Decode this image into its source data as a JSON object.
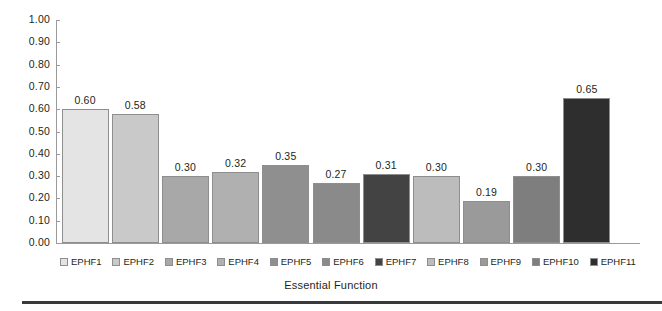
{
  "chart_data": {
    "type": "bar",
    "title": "",
    "subtitle": "",
    "xlabel": "Essential Function",
    "ylabel": "",
    "ylim": [
      0,
      1.0
    ],
    "ytick_step": 0.1,
    "grid": false,
    "legend_position": "bottom",
    "categories": [
      "EPHF1",
      "EPHF2",
      "EPHF3",
      "EPHF4",
      "EPHF5",
      "EPHF6",
      "EPHF7",
      "EPHF8",
      "EPHF9",
      "EPHF10",
      "EPHF11"
    ],
    "values": [
      0.6,
      0.58,
      0.3,
      0.32,
      0.35,
      0.27,
      0.31,
      0.3,
      0.19,
      0.3,
      0.65
    ],
    "value_labels": [
      "0.60",
      "0.58",
      "0.30",
      "0.32",
      "0.35",
      "0.27",
      "0.31",
      "0.30",
      "0.19",
      "0.30",
      "0.65"
    ],
    "bar_colors": [
      "#e4e4e4",
      "#c9c9c9",
      "#a8a8a8",
      "#b0b0b0",
      "#8f8f8f",
      "#8a8a8a",
      "#434343",
      "#bcbcbc",
      "#9a9a9a",
      "#7e7e7e",
      "#2e2e2e"
    ],
    "ytick_labels": [
      "1.00",
      "0.90",
      "0.80",
      "0.70",
      "0.60",
      "0.50",
      "0.40",
      "0.30",
      "0.20",
      "0.10",
      "0.00"
    ],
    "ytick_values": [
      1.0,
      0.9,
      0.8,
      0.7,
      0.6,
      0.5,
      0.4,
      0.3,
      0.2,
      0.1,
      0.0
    ],
    "axis_color": "#9a9a9a",
    "text_color": "#231f20"
  },
  "legend": {
    "items": [
      {
        "label": "EPHF1",
        "color": "#e4e4e4"
      },
      {
        "label": "EPHF2",
        "color": "#c9c9c9"
      },
      {
        "label": "EPHF3",
        "color": "#a8a8a8"
      },
      {
        "label": "EPHF4",
        "color": "#b0b0b0"
      },
      {
        "label": "EPHF5",
        "color": "#8f8f8f"
      },
      {
        "label": "EPHF6",
        "color": "#8a8a8a"
      },
      {
        "label": "EPHF7",
        "color": "#434343"
      },
      {
        "label": "EPHF8",
        "color": "#bcbcbc"
      },
      {
        "label": "EPHF9",
        "color": "#9a9a9a"
      },
      {
        "label": "EPHF10",
        "color": "#7e7e7e"
      },
      {
        "label": "EPHF11",
        "color": "#2e2e2e"
      }
    ]
  },
  "footer": {
    "rule_color": "#3a3a3c"
  }
}
